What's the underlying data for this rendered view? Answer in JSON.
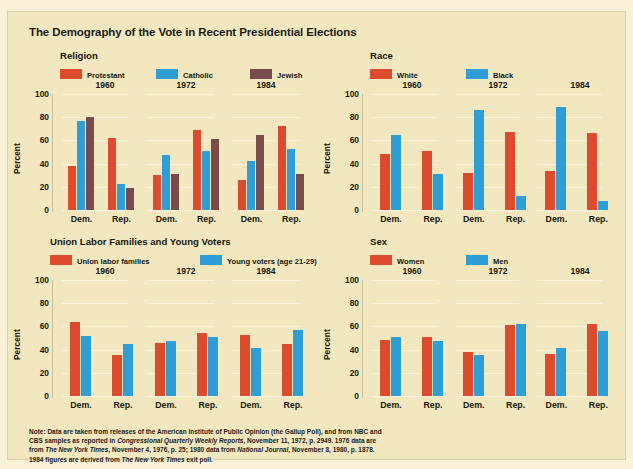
{
  "title": "The Demography of the Vote in Recent Presidential Elections",
  "colors": {
    "red": "#dd4b2e",
    "blue": "#2f9ed4",
    "brown": "#7a4b4b",
    "background": "#f3e7bf",
    "outer": "#faf2d8",
    "grid": "#fbf5e2",
    "text": "#17170f"
  },
  "axis": {
    "ylabel": "Percent",
    "ticks": [
      "100",
      "80",
      "60",
      "40",
      "20",
      "0"
    ],
    "ylim": [
      0,
      100
    ],
    "xlabels": [
      "Dem.",
      "Rep."
    ]
  },
  "years": [
    "1960",
    "1972",
    "1984"
  ],
  "panels": [
    {
      "name": "religion",
      "title": "Religion",
      "legend": [
        {
          "label": "Protestant",
          "color": "#dd4b2e"
        },
        {
          "label": "Catholic",
          "color": "#2f9ed4"
        },
        {
          "label": "Jewish",
          "color": "#7a4b4b"
        }
      ]
    },
    {
      "name": "race",
      "title": "Race",
      "legend": [
        {
          "label": "White",
          "color": "#dd4b2e"
        },
        {
          "label": "Black",
          "color": "#2f9ed4"
        }
      ]
    },
    {
      "name": "union-young",
      "title": "Union Labor Families and Young Voters",
      "legend": [
        {
          "label": "Union labor families",
          "color": "#dd4b2e"
        },
        {
          "label": "Young voters (age 21-29)",
          "color": "#2f9ed4"
        }
      ]
    },
    {
      "name": "sex",
      "title": "Sex",
      "legend": [
        {
          "label": "Women",
          "color": "#dd4b2e"
        },
        {
          "label": "Men",
          "color": "#2f9ed4"
        }
      ]
    }
  ],
  "note_lines": [
    "Note: Data are taken from releases of the American Institute of Public Opinion (the Gallup Poll), and from NBC and",
    "CBS samples as reported in <i>Congressional Quarterly Weekly Reports</i>, November 11, 1972, p. 2949. 1976 data are",
    "from <i>The New York Times</i>, November 4, 1976, p. 25; 1980 data from <i>National Journal</i>, November 8, 1980, p. 1878.",
    "1984 figures are derived from <i>The New York Times</i> exit poll."
  ],
  "chart_data": [
    {
      "type": "bar",
      "name": "religion",
      "title": "Religion",
      "xlabel": "",
      "ylabel": "Percent",
      "ylim": [
        0,
        100
      ],
      "yticks": [
        0,
        20,
        40,
        60,
        80,
        100
      ],
      "grid": true,
      "legend_position": "top",
      "groups": [
        "1960 Dem.",
        "1960 Rep.",
        "1972 Dem.",
        "1972 Rep.",
        "1984 Dem.",
        "1984 Rep."
      ],
      "series": [
        {
          "name": "Protestant",
          "color": "#dd4b2e",
          "values": [
            38,
            62,
            30,
            69,
            26,
            72
          ]
        },
        {
          "name": "Catholic",
          "color": "#2f9ed4",
          "values": [
            77,
            22,
            47,
            51,
            42,
            53
          ]
        },
        {
          "name": "Jewish",
          "color": "#7a4b4b",
          "values": [
            80,
            19,
            31,
            61,
            65,
            31
          ]
        }
      ]
    },
    {
      "type": "bar",
      "name": "race",
      "title": "Race",
      "xlabel": "",
      "ylabel": "Percent",
      "ylim": [
        0,
        100
      ],
      "yticks": [
        0,
        20,
        40,
        60,
        80,
        100
      ],
      "grid": true,
      "legend_position": "top",
      "groups": [
        "1960 Dem.",
        "1960 Rep.",
        "1972 Dem.",
        "1972 Rep.",
        "1984 Dem.",
        "1984 Rep."
      ],
      "series": [
        {
          "name": "White",
          "color": "#dd4b2e",
          "values": [
            48,
            51,
            32,
            67,
            34,
            66
          ]
        },
        {
          "name": "Black",
          "color": "#2f9ed4",
          "values": [
            65,
            31,
            86,
            12,
            89,
            8
          ]
        }
      ]
    },
    {
      "type": "bar",
      "name": "union-young",
      "title": "Union Labor Families and Young Voters",
      "xlabel": "",
      "ylabel": "Percent",
      "ylim": [
        0,
        100
      ],
      "yticks": [
        0,
        20,
        40,
        60,
        80,
        100
      ],
      "grid": true,
      "legend_position": "top",
      "groups": [
        "1960 Dem.",
        "1960 Rep.",
        "1972 Dem.",
        "1972 Rep.",
        "1984 Dem.",
        "1984 Rep."
      ],
      "series": [
        {
          "name": "Union labor families",
          "color": "#dd4b2e",
          "values": [
            64,
            35,
            46,
            54,
            53,
            45
          ]
        },
        {
          "name": "Young voters (age 21-29)",
          "color": "#2f9ed4",
          "values": [
            52,
            45,
            47,
            51,
            41,
            57
          ]
        }
      ]
    },
    {
      "type": "bar",
      "name": "sex",
      "title": "Sex",
      "xlabel": "",
      "ylabel": "Percent",
      "ylim": [
        0,
        100
      ],
      "yticks": [
        0,
        20,
        40,
        60,
        80,
        100
      ],
      "grid": true,
      "legend_position": "top",
      "groups": [
        "1960 Dem.",
        "1960 Rep.",
        "1972 Dem.",
        "1972 Rep.",
        "1984 Dem.",
        "1984 Rep."
      ],
      "series": [
        {
          "name": "Women",
          "color": "#dd4b2e",
          "values": [
            48,
            51,
            38,
            61,
            36,
            62
          ]
        },
        {
          "name": "Men",
          "color": "#2f9ed4",
          "values": [
            51,
            47,
            35,
            62,
            41,
            56
          ]
        }
      ]
    }
  ]
}
